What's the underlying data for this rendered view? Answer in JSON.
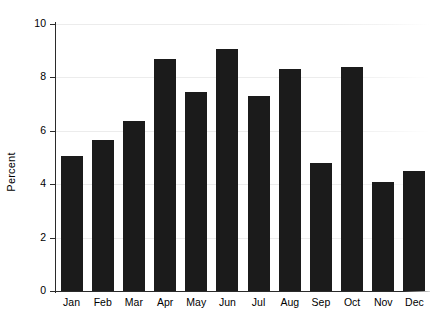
{
  "chart_data": {
    "type": "bar",
    "title": "",
    "subtitle": "",
    "xlabel": "",
    "ylabel": "Percent",
    "categories": [
      "Jan",
      "Feb",
      "Mar",
      "Apr",
      "May",
      "Jun",
      "Jul",
      "Aug",
      "Sep",
      "Oct",
      "Nov",
      "Dec"
    ],
    "values": [
      5.05,
      5.65,
      6.35,
      8.7,
      7.45,
      9.05,
      7.3,
      8.3,
      4.8,
      8.4,
      4.1,
      4.5
    ],
    "ylim": [
      0,
      10
    ],
    "y_ticks": [
      0,
      2,
      4,
      6,
      8,
      10
    ],
    "y_tick_labels": [
      "0",
      "2",
      "4",
      "6",
      "8",
      "10"
    ],
    "grid": true,
    "grid_axis": "y",
    "legend": false,
    "legend_position": "none",
    "bar_color": "#1b1b1b",
    "grid_color": "#ececec",
    "axis_color": "#2b2b2b",
    "background_color": "#ffffff"
  }
}
